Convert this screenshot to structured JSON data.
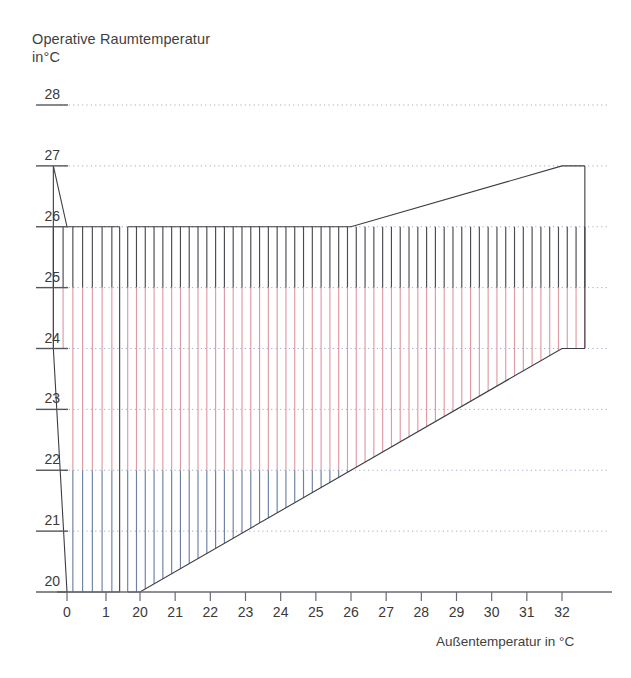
{
  "chart_data": {
    "type": "area",
    "title": "Operative Raumtemperatur\nin°C",
    "ylabel": "Operative Raumtemperatur in°C",
    "xlabel": "Außentemperatur in °C",
    "grid": true,
    "legend": "none",
    "x_axis": {
      "broken": true,
      "segments": [
        {
          "ticks": [
            0,
            1
          ],
          "tick_labels": [
            "0",
            "1"
          ]
        },
        {
          "ticks": [
            20,
            21,
            22,
            23,
            24,
            25,
            26,
            27,
            28,
            29,
            30,
            31,
            32
          ],
          "tick_labels": [
            "20",
            "21",
            "22",
            "23",
            "24",
            "25",
            "26",
            "27",
            "28",
            "29",
            "30",
            "31",
            "32"
          ]
        }
      ],
      "xlim_left": [
        -0.35,
        1.35
      ],
      "xlim_right": [
        19.65,
        32.65
      ]
    },
    "y_axis": {
      "ticks": [
        20,
        21,
        22,
        23,
        24,
        25,
        26,
        27,
        28
      ],
      "tick_labels": [
        "20",
        "21",
        "22",
        "23",
        "24",
        "25",
        "26",
        "27",
        "28"
      ],
      "ylim": [
        20,
        28
      ]
    },
    "bands": [
      {
        "name": "upper-grey-band",
        "color": "#4a4a52",
        "y_low": 25,
        "y_high": 26,
        "description": "Hatched grey zone between 25 and 26 degrees, upper boundary follows comfort limit"
      },
      {
        "name": "middle-pink-band",
        "color": "#e09aa4",
        "y_low": 22,
        "y_high": 25,
        "description": "Hatched pink zone between 22 and 25 degrees"
      },
      {
        "name": "lower-blue-band",
        "color": "#6d80a4",
        "y_low": 20,
        "y_high": 22,
        "description": "Hatched blue zone between 20 and 22 degrees"
      }
    ],
    "boundaries": {
      "upper": {
        "name": "upper-comfort-limit",
        "color": "#3c3c44",
        "points": [
          [
            0,
            26
          ],
          [
            1,
            26
          ],
          [
            20,
            26
          ],
          [
            26,
            26
          ],
          [
            32,
            27
          ]
        ]
      },
      "lower": {
        "name": "lower-comfort-limit",
        "color": "#3c3c44",
        "points": [
          [
            0,
            20
          ],
          [
            1,
            20
          ],
          [
            20,
            20
          ],
          [
            26,
            22
          ],
          [
            32,
            24
          ]
        ]
      }
    },
    "series": [
      {
        "name": "comfort-zone-upper-bound",
        "x": [
          0,
          1,
          20,
          26,
          32
        ],
        "y": [
          26,
          26,
          26,
          26,
          27
        ]
      },
      {
        "name": "comfort-zone-lower-bound",
        "x": [
          0,
          1,
          20,
          26,
          32
        ],
        "y": [
          20,
          20,
          20,
          22,
          24
        ]
      }
    ],
    "hatch": {
      "style": "vertical-lines",
      "spacing_deg": 0.25,
      "colors": {
        "grey": "#4a4a52",
        "pink": "#e09aa4",
        "blue": "#6d80a4"
      }
    },
    "colors": {
      "grid": "#8ea0c0",
      "axis": "#6a6a72",
      "text": "#3a3a3a",
      "grey": "#4a4a52",
      "pink": "#e09aa4",
      "blue": "#6d80a4"
    }
  }
}
